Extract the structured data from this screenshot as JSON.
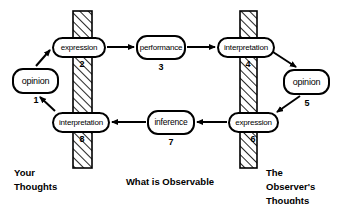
{
  "diagram": {
    "colors": {
      "stroke": "#000000",
      "fill": "#ffffff",
      "background": "#ffffff",
      "hatch": "#000000"
    },
    "barriers": [
      {
        "name": "left-barrier",
        "x": 73,
        "y": 11,
        "width": 19,
        "height": 157
      },
      {
        "name": "right-barrier",
        "x": 240,
        "y": 11,
        "width": 17,
        "height": 157
      }
    ],
    "nodes": [
      {
        "id": "opinion-1",
        "label": "opinion",
        "number": "1",
        "x": 12,
        "y": 68,
        "w": 47,
        "h": 26,
        "font": 9,
        "num_x": 24,
        "num_y": 96,
        "num_w": 24
      },
      {
        "id": "expression-2",
        "label": "expression",
        "number": "2",
        "x": 52,
        "y": 37,
        "w": 54,
        "h": 21,
        "font": 8,
        "num_x": 70,
        "num_y": 60,
        "num_w": 24
      },
      {
        "id": "performance-3",
        "label": "performance",
        "number": "3",
        "x": 136,
        "y": 35,
        "w": 50,
        "h": 25,
        "font": 8,
        "num_x": 149,
        "num_y": 63,
        "num_w": 24
      },
      {
        "id": "interpretation-4",
        "label": "interpretation",
        "number": "4",
        "x": 217,
        "y": 37,
        "w": 58,
        "h": 21,
        "font": 8,
        "num_x": 236,
        "num_y": 60,
        "num_w": 24
      },
      {
        "id": "opinion-5",
        "label": "opinion",
        "number": "5",
        "x": 283,
        "y": 69,
        "w": 47,
        "h": 26,
        "font": 9,
        "num_x": 295,
        "num_y": 99,
        "num_w": 24
      },
      {
        "id": "expression-6",
        "label": "expression",
        "number": "6",
        "x": 228,
        "y": 112,
        "w": 51,
        "h": 21,
        "font": 8,
        "num_x": 241,
        "num_y": 135,
        "num_w": 24
      },
      {
        "id": "inference-7",
        "label": "inference",
        "number": "7",
        "x": 147,
        "y": 110,
        "w": 48,
        "h": 25,
        "font": 8.5,
        "num_x": 159,
        "num_y": 138,
        "num_w": 24
      },
      {
        "id": "interpretation-8",
        "label": "interpretation",
        "number": "8",
        "x": 52,
        "y": 112,
        "w": 58,
        "h": 21,
        "font": 8,
        "num_x": 70,
        "num_y": 135,
        "num_w": 24
      }
    ],
    "edges": [
      {
        "name": "edge-opinion1-to-expression2",
        "from": "opinion-1",
        "to": "expression-2",
        "path": "M 36 66 L 50 50"
      },
      {
        "name": "edge-expression2-to-performance3",
        "from": "expression-2",
        "to": "performance-3",
        "path": "M 107 47 L 134 47"
      },
      {
        "name": "edge-performance3-to-interpretation4",
        "from": "performance-3",
        "to": "interpretation-4",
        "path": "M 187 47 L 215 47"
      },
      {
        "name": "edge-interpretation4-to-opinion5",
        "from": "interpretation-4",
        "to": "opinion-5",
        "path": "M 273 52 L 296 67"
      },
      {
        "name": "edge-opinion5-to-expression6",
        "from": "opinion-5",
        "to": "expression-6",
        "path": "M 300 96 L 277 112"
      },
      {
        "name": "edge-expression6-to-inference7",
        "from": "expression-6",
        "to": "inference-7",
        "path": "M 227 122 L 197 122"
      },
      {
        "name": "edge-inference7-to-interpretation8",
        "from": "inference-7",
        "to": "interpretation-8",
        "path": "M 146 122 L 112 122"
      },
      {
        "name": "edge-interpretation8-to-opinion1",
        "from": "interpretation-8",
        "to": "opinion-1",
        "path": "M 55 111 L 40 97"
      }
    ],
    "captions": [
      {
        "id": "caption-your-thoughts",
        "lines": [
          "Your",
          "Thoughts"
        ],
        "x": 14,
        "y": 166,
        "align": "left"
      },
      {
        "id": "caption-what-observable",
        "lines": [
          "What is Observable"
        ],
        "x": 110,
        "y": 175,
        "align": "center",
        "w": 120
      },
      {
        "id": "caption-observers-thoughts",
        "lines": [
          "The",
          "Observer's",
          "Thoughts"
        ],
        "x": 266,
        "y": 166,
        "align": "left"
      }
    ]
  }
}
